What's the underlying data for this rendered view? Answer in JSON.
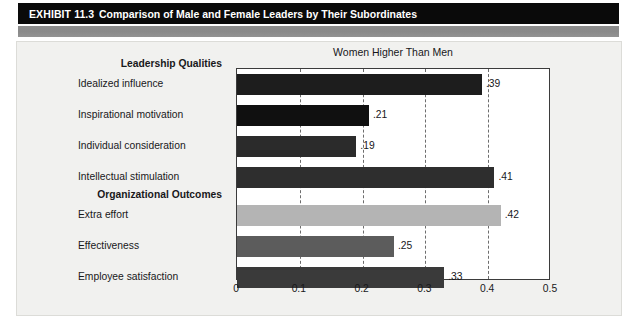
{
  "header": {
    "exhibit_label": "EXHIBIT",
    "exhibit_number": "11.3",
    "title": "Comparison of Male and Female Leaders by Their Subordinates"
  },
  "chart_data": {
    "type": "bar",
    "orientation": "horizontal",
    "title": "Women Higher Than Men",
    "xlabel": "",
    "ylabel": "",
    "xlim": [
      0,
      0.5
    ],
    "grid": true,
    "gridlines": [
      0.1,
      0.2,
      0.3,
      0.4
    ],
    "xticks": [
      0,
      0.1,
      0.2,
      0.3,
      0.4,
      0.5
    ],
    "xtick_labels": [
      "0",
      "0.1",
      "0.2",
      "0.3",
      "0.4",
      "0.5"
    ],
    "groups": [
      {
        "label": "Leadership Qualities"
      },
      {
        "label": "Organizational Outcomes"
      }
    ],
    "categories": [
      "Idealized influence",
      "Inspirational motivation",
      "Individual consideration",
      "Intellectual stimulation",
      "Extra effort",
      "Effectiveness",
      "Employee satisfaction"
    ],
    "values": [
      0.39,
      0.21,
      0.19,
      0.41,
      0.42,
      0.25,
      0.33
    ],
    "value_labels": [
      ".39",
      ".21",
      ".19",
      ".41",
      ".42",
      ".25",
      ".33"
    ],
    "bar_colors": [
      "#1d1d1d",
      "#101010",
      "#2b2b2b",
      "#2e2e2e",
      "#b4b4b4",
      "#5c5c5c",
      "#3a3a3a"
    ]
  },
  "colors": {
    "header_bar": "#0a0a0a",
    "header_text": "#ffffff",
    "band": "#8d8d8d",
    "panel_bg": "#f1f1ef",
    "plot_bg": "#ffffff",
    "axis": "#3b3b3b",
    "gridline": "#6d6d6d",
    "text": "#18181a"
  }
}
